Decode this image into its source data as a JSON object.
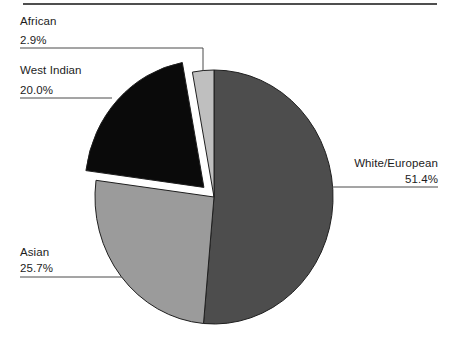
{
  "chart_data": {
    "type": "pie",
    "title": "",
    "start_angle_deg": 0,
    "direction": "clockwise",
    "unit": "percent",
    "legend_position": "none",
    "labels_style": "callout-with-leader-lines",
    "slices": [
      {
        "label": "White/European",
        "value": 51.4,
        "pct_label": "51.4%",
        "color": "#4d4d4d",
        "exploded": false
      },
      {
        "label": "Asian",
        "value": 25.7,
        "pct_label": "25.7%",
        "color": "#9b9b9b",
        "exploded": false
      },
      {
        "label": "West Indian",
        "value": 20.0,
        "pct_label": "20.0%",
        "color": "#0a0a0a",
        "exploded": true
      },
      {
        "label": "African",
        "value": 2.9,
        "pct_label": "2.9%",
        "color": "#bfbfbf",
        "exploded": false
      }
    ]
  },
  "styles": {
    "background": "#ffffff",
    "slice_stroke": "#1f1f1f",
    "leader_line_color": "#4a4a4a",
    "text_color": "#1c1c1c",
    "top_rule_color": "#4f4f4f"
  }
}
